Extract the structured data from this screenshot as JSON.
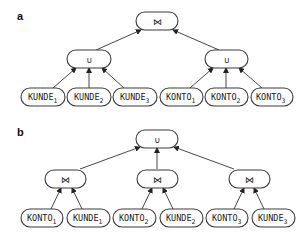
{
  "panels": [
    {
      "label": "a",
      "root": {
        "symbol": "⋈",
        "kind": "join"
      },
      "middle": [
        {
          "symbol": "∪",
          "kind": "union"
        },
        {
          "symbol": "∪",
          "kind": "union"
        }
      ],
      "leaves": [
        {
          "name": "KUNDE",
          "sub": "1"
        },
        {
          "name": "KUNDE",
          "sub": "2"
        },
        {
          "name": "KUNDE",
          "sub": "3"
        },
        {
          "name": "KONTO",
          "sub": "1"
        },
        {
          "name": "KONTO",
          "sub": "2"
        },
        {
          "name": "KONTO",
          "sub": "3"
        }
      ]
    },
    {
      "label": "b",
      "root": {
        "symbol": "∪",
        "kind": "union"
      },
      "middle": [
        {
          "symbol": "⋈",
          "kind": "join"
        },
        {
          "symbol": "⋈",
          "kind": "join"
        },
        {
          "symbol": "⋈",
          "kind": "join"
        }
      ],
      "leaves": [
        {
          "name": "KONTO",
          "sub": "1"
        },
        {
          "name": "KUNDE",
          "sub": "1"
        },
        {
          "name": "KONTO",
          "sub": "2"
        },
        {
          "name": "KUNDE",
          "sub": "2"
        },
        {
          "name": "KONTO",
          "sub": "3"
        },
        {
          "name": "KUNDE",
          "sub": "3"
        }
      ]
    }
  ]
}
